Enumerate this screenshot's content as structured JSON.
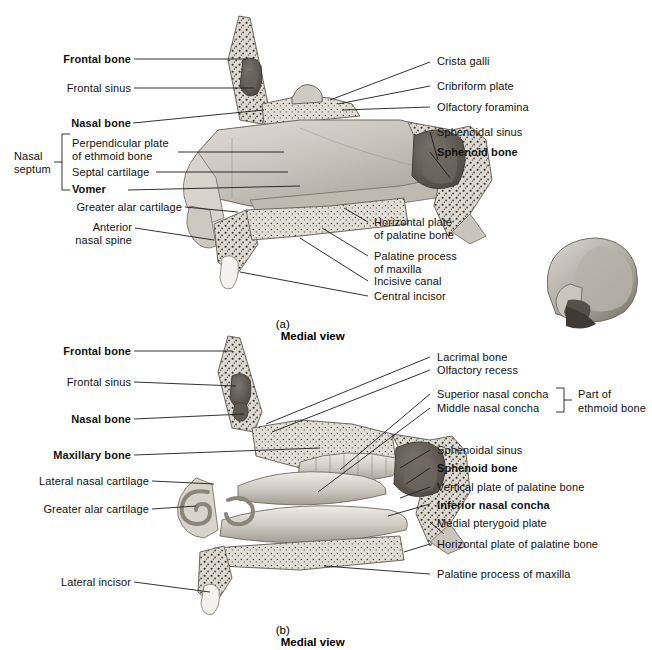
{
  "figure": {
    "background_color": "#ffffff",
    "line_color": "#1b1b1b",
    "panels": [
      {
        "id": "a",
        "caption_letter": "(a)",
        "caption_text": "Medial view",
        "view": "Medial view of nasal septum"
      },
      {
        "id": "b",
        "caption_letter": "(b)",
        "caption_text": "Medial view",
        "view": "Medial view of lateral nasal wall"
      }
    ]
  },
  "panel_a": {
    "labels_left": [
      {
        "text": "Frontal bone",
        "bold": true
      },
      {
        "text": "Frontal sinus",
        "bold": false
      },
      {
        "text": "Nasal bone",
        "bold": true
      },
      {
        "text": "Perpendicular plate",
        "bold": false
      },
      {
        "text": "of ethmoid bone",
        "bold": false
      },
      {
        "text": "Septal cartilage",
        "bold": false
      },
      {
        "text": "Vomer",
        "bold": true
      },
      {
        "text": "Greater alar cartilage",
        "bold": false
      },
      {
        "text": "Anterior",
        "bold": false
      },
      {
        "text": "nasal spine",
        "bold": false
      }
    ],
    "bracket_label": {
      "line1": "Nasal",
      "line2": "septum"
    },
    "labels_right": [
      {
        "text": "Crista galli",
        "bold": false
      },
      {
        "text": "Cribriform plate",
        "bold": false
      },
      {
        "text": "Olfactory foramina",
        "bold": false
      },
      {
        "text": "Sphenoidal sinus",
        "bold": false
      },
      {
        "text": "Sphenoid bone",
        "bold": true
      },
      {
        "text": "Horizontal plate",
        "bold": false
      },
      {
        "text": "of palatine bone",
        "bold": false
      },
      {
        "text": "Palatine process",
        "bold": false
      },
      {
        "text": "of maxilla",
        "bold": false
      },
      {
        "text": "Incisive canal",
        "bold": false
      },
      {
        "text": "Central incisor",
        "bold": false
      }
    ]
  },
  "panel_b": {
    "labels_left": [
      {
        "text": "Frontal bone",
        "bold": true
      },
      {
        "text": "Frontal sinus",
        "bold": false
      },
      {
        "text": "Nasal bone",
        "bold": true
      },
      {
        "text": "Maxillary bone",
        "bold": true
      },
      {
        "text": "Lateral nasal cartilage",
        "bold": false
      },
      {
        "text": "Greater alar cartilage",
        "bold": false
      },
      {
        "text": "Lateral incisor",
        "bold": false
      }
    ],
    "labels_right": [
      {
        "text": "Lacrimal bone",
        "bold": false
      },
      {
        "text": "Olfactory recess",
        "bold": false
      },
      {
        "text": "Superior nasal concha",
        "bold": false
      },
      {
        "text": "Middle nasal concha",
        "bold": false
      },
      {
        "text": "Sphenoidal sinus",
        "bold": false
      },
      {
        "text": "Sphenoid bone",
        "bold": true
      },
      {
        "text": "Vertical plate of palatine bone",
        "bold": false
      },
      {
        "text": "Inferior nasal concha",
        "bold": true
      },
      {
        "text": "Medial pterygoid plate",
        "bold": false
      },
      {
        "text": "Horizontal plate of palatine bone",
        "bold": false
      },
      {
        "text": "Palatine process of maxilla",
        "bold": false
      }
    ],
    "bracket_label": {
      "line1": "Part of",
      "line2": "ethmoid bone"
    }
  },
  "inset": {
    "name": "orientation-skull-lateral"
  }
}
